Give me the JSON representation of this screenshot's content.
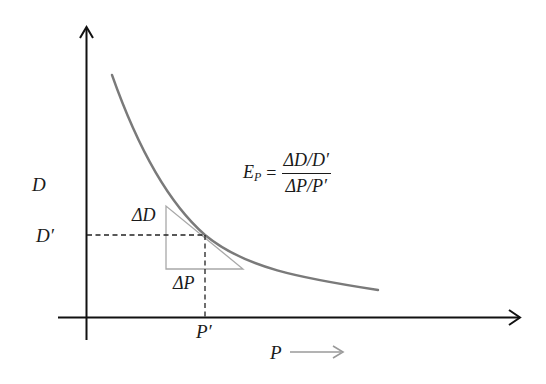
{
  "diagram": {
    "axes": {
      "y_label": "D",
      "x_label": "P",
      "x_direction_arrow": "long-right-arrow"
    },
    "reference_point": {
      "d_label": "D′",
      "p_label": "P′"
    },
    "triangle": {
      "delta_d_label": "ΔD",
      "delta_p_label": "ΔP"
    },
    "formula": {
      "lhs": "E",
      "lhs_subscript": "P",
      "equals": "=",
      "numerator": "ΔD/D′",
      "denominator": "ΔP/P′"
    },
    "colors": {
      "axis": "#111111",
      "curve": "#7a7a7a",
      "triangle": "#a8a8a8",
      "dashed": "#222222",
      "p_arrow": "#9a9a9a"
    }
  }
}
